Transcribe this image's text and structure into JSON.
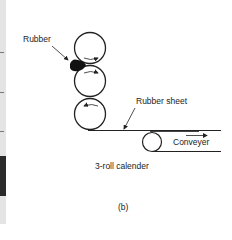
{
  "figure": {
    "panel_label": "(b)",
    "caption": "3-roll calender",
    "labels": {
      "rubber": "Rubber",
      "rubber_sheet": "Rubber sheet",
      "conveyer": "Conveyer"
    },
    "rolls": [
      {
        "name": "top-roll",
        "rotation": "clockwise"
      },
      {
        "name": "middle-roll",
        "rotation": "clockwise"
      },
      {
        "name": "bottom-roll",
        "rotation": "counter-clockwise"
      }
    ],
    "conveyer_roll": {
      "name": "conveyer-roll"
    },
    "colors": {
      "line": "#222222",
      "rubber": "#111111"
    }
  }
}
